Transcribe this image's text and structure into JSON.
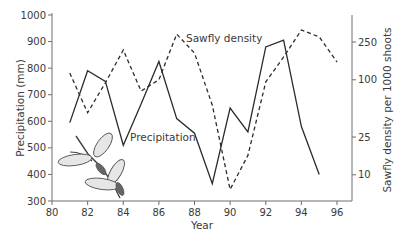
{
  "chart_data": {
    "type": "line",
    "title": "",
    "xlabel": "Year",
    "ylabel": "Precipitation (mm)",
    "ylabel_right": "Sawfly density per 1000 shoots",
    "xlim": [
      80,
      96
    ],
    "ylim": [
      300,
      1000
    ],
    "ylim_right": [
      10,
      250
    ],
    "right_axis_scale": "log",
    "grid": false,
    "x_ticks": [
      80,
      82,
      84,
      86,
      88,
      90,
      92,
      94,
      96
    ],
    "y_ticks": [
      300,
      400,
      500,
      600,
      700,
      800,
      900,
      1000
    ],
    "y_ticks_right": [
      10,
      25,
      100,
      250
    ],
    "series": [
      {
        "name": "Precipitation",
        "axis": "left",
        "style": "solid",
        "x": [
          81,
          82,
          83,
          84,
          85,
          86,
          87,
          88,
          89,
          90,
          91,
          92,
          93,
          94,
          95
        ],
        "values": [
          595,
          790,
          750,
          510,
          665,
          825,
          610,
          555,
          365,
          650,
          560,
          880,
          905,
          580,
          400
        ]
      },
      {
        "name": "Sawfly density",
        "axis": "right",
        "style": "dashed",
        "x": [
          81,
          82,
          83,
          84,
          85,
          86,
          87,
          88,
          89,
          90,
          91,
          92,
          93,
          94,
          95,
          96
        ],
        "values": [
          118,
          45,
          93,
          206,
          76,
          100,
          303,
          191,
          54,
          7,
          16,
          95,
          174,
          334,
          283,
          154
        ]
      }
    ],
    "annotations": [
      {
        "text": "Sawfly density",
        "near": "series-sawfly"
      },
      {
        "text": "Precipitation",
        "near": "series-precipitation"
      }
    ],
    "illustration": "sawfly-on-twig"
  },
  "colors": {
    "line": "#2b2b2b",
    "axis": "#6e6e6e",
    "text": "#3a3a3a",
    "wing_fill": "#e6e6e6"
  }
}
